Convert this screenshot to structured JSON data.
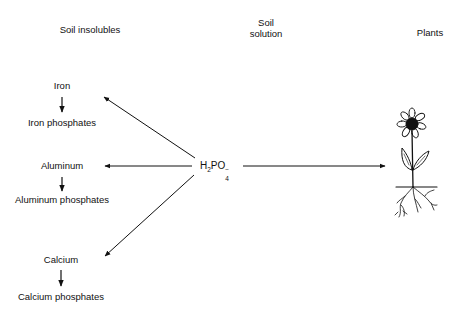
{
  "headers": {
    "soil_insolubles": "Soil insolubles",
    "soil_solution_line1": "Soil",
    "soil_solution_line2": "solution",
    "plants": "Plants"
  },
  "center_species": {
    "base": "H",
    "sub1": "2",
    "mid": "PO",
    "sub2": "4",
    "charge": "−"
  },
  "insolubles": [
    {
      "element": "Iron",
      "product": "Iron phosphates"
    },
    {
      "element": "Aluminum",
      "product": "Aluminum phosphates"
    },
    {
      "element": "Calcium",
      "product": "Calcium phosphates"
    }
  ],
  "icons": {
    "plant": "flowering-plant-with-roots"
  },
  "colors": {
    "ink": "#111111",
    "background": "#ffffff"
  }
}
